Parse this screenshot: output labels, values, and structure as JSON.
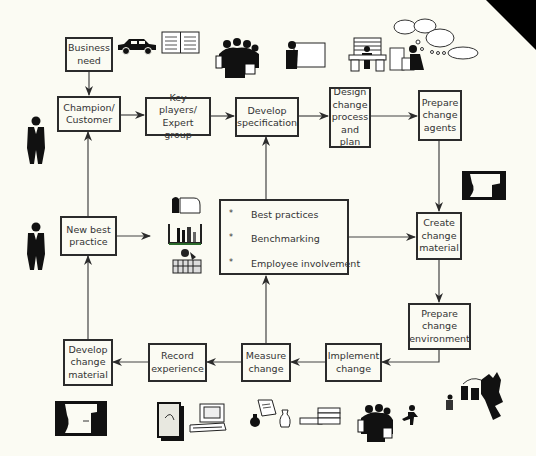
{
  "diagram": {
    "boxes": {
      "business_need": [
        "Business",
        "need"
      ],
      "champion": [
        "Champion/",
        "Customer"
      ],
      "key_players": [
        "Key players/",
        "Expert group"
      ],
      "develop_spec": [
        "Develop",
        "specification"
      ],
      "design_change": [
        "Design",
        "change",
        "process",
        "and plan"
      ],
      "prepare_agents": [
        "Prepare",
        "change",
        "agents"
      ],
      "new_best_practice": [
        "New best",
        "practice"
      ],
      "create_material": [
        "Create",
        "change",
        "material"
      ],
      "prepare_environment": [
        "Prepare",
        "change",
        "environment"
      ],
      "implement_change": [
        "Implement",
        "change"
      ],
      "measure_change": [
        "Measure",
        "change"
      ],
      "record_experience": [
        "Record",
        "experience"
      ],
      "develop_material": [
        "Develop",
        "change",
        "material"
      ]
    },
    "center_box": {
      "bullet": "*",
      "items": [
        "Best practices",
        "Benchmarking",
        "Employee involvement"
      ]
    },
    "flow": [
      [
        "Business need",
        "Champion/Customer"
      ],
      [
        "Champion/Customer",
        "Key players/Expert group"
      ],
      [
        "Key players/Expert group",
        "Develop specification"
      ],
      [
        "Develop specification",
        "Design change process and plan"
      ],
      [
        "Design change process and plan",
        "Prepare change agents"
      ],
      [
        "Prepare change agents",
        "Create change material"
      ],
      [
        "Create change material",
        "Prepare change environment"
      ],
      [
        "Prepare change environment",
        "Implement change"
      ],
      [
        "Implement change",
        "Measure change"
      ],
      [
        "Measure change",
        "Record experience"
      ],
      [
        "Record experience",
        "Develop change material"
      ],
      [
        "Develop change material",
        "New best practice"
      ],
      [
        "New best practice",
        "Champion/Customer"
      ],
      [
        "New best practice",
        "Best practices icons"
      ],
      [
        "Measure change",
        "Best practices box"
      ],
      [
        "Best practices box",
        "Develop specification"
      ],
      [
        "Best practices box",
        "Create change material"
      ]
    ],
    "icons": [
      "car-icon",
      "open-book-icon",
      "group-meeting-icon",
      "presenter-board-icon",
      "office-desk-icon",
      "thinking-person-icon",
      "businessman-icon",
      "businessman-icon",
      "tools-icon",
      "lab-equipment-icon",
      "factory-icon",
      "conversation-icon",
      "conversation-icon",
      "document-icon",
      "computer-icon",
      "scroll-icon",
      "vase-icon",
      "books-icon",
      "group-icon",
      "runner-icon",
      "industry-icon"
    ],
    "colors": {
      "background": "#fbfbf3",
      "line": "#2b2b2b",
      "text": "#333333"
    }
  }
}
